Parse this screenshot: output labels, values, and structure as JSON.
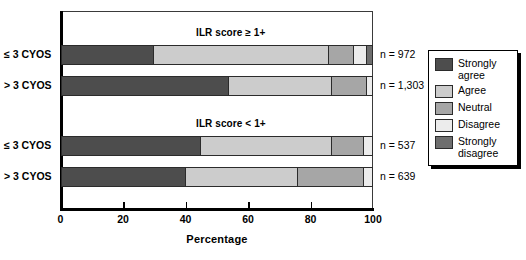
{
  "chart_data": {
    "type": "bar",
    "orientation": "horizontal",
    "stacked": true,
    "title": "",
    "xlabel": "Percentage",
    "ylabel": "",
    "xlim": [
      0,
      100
    ],
    "xticks": [
      0,
      20,
      40,
      60,
      80,
      100
    ],
    "grid": false,
    "legend_position": "right-outside",
    "legend": [
      "Strongly agree",
      "Agree",
      "Neutral",
      "Disagree",
      "Strongly disagree"
    ],
    "series": [
      {
        "name": "Strongly agree",
        "color": "#4d4d4d",
        "values": [
          30,
          54,
          45,
          40
        ]
      },
      {
        "name": "Agree",
        "color": "#cccccc",
        "values": [
          56,
          33,
          42,
          36
        ]
      },
      {
        "name": "Neutral",
        "color": "#a6a6a6",
        "values": [
          8,
          11,
          10,
          21
        ]
      },
      {
        "name": "Disagree",
        "color": "#ececec",
        "values": [
          4,
          2,
          3,
          3
        ]
      },
      {
        "name": "Strongly disagree",
        "color": "#6e6e6e",
        "values": [
          2,
          0,
          0,
          0
        ]
      }
    ],
    "groups": [
      {
        "title": "ILR score ≥ 1+",
        "categories": [
          "≤ 3 CYOS",
          "> 3 CYOS"
        ],
        "n": [
          "n = 972",
          "n = 1,303"
        ]
      },
      {
        "title": "ILR score < 1+",
        "categories": [
          "≤ 3 CYOS",
          "> 3 CYOS"
        ],
        "n": [
          "n = 537",
          "n = 639"
        ]
      }
    ],
    "bars": [
      {
        "category": "≤ 3 CYOS",
        "group": "ILR score ≥ 1+",
        "n_label": "n = 972",
        "segments": [
          {
            "label": "Strongly agree",
            "value": 30,
            "color": "#4d4d4d"
          },
          {
            "label": "Agree",
            "value": 56,
            "color": "#cccccc"
          },
          {
            "label": "Neutral",
            "value": 8,
            "color": "#a6a6a6"
          },
          {
            "label": "Disagree",
            "value": 4,
            "color": "#ececec"
          },
          {
            "label": "Strongly disagree",
            "value": 2,
            "color": "#6e6e6e"
          }
        ]
      },
      {
        "category": "> 3 CYOS",
        "group": "ILR score ≥ 1+",
        "n_label": "n = 1,303",
        "segments": [
          {
            "label": "Strongly agree",
            "value": 54,
            "color": "#4d4d4d"
          },
          {
            "label": "Agree",
            "value": 33,
            "color": "#cccccc"
          },
          {
            "label": "Neutral",
            "value": 11,
            "color": "#a6a6a6"
          },
          {
            "label": "Disagree",
            "value": 2,
            "color": "#ececec"
          }
        ]
      },
      {
        "category": "≤ 3 CYOS",
        "group": "ILR score < 1+",
        "n_label": "n = 537",
        "segments": [
          {
            "label": "Strongly agree",
            "value": 45,
            "color": "#4d4d4d"
          },
          {
            "label": "Agree",
            "value": 42,
            "color": "#cccccc"
          },
          {
            "label": "Neutral",
            "value": 10,
            "color": "#a6a6a6"
          },
          {
            "label": "Disagree",
            "value": 3,
            "color": "#ececec"
          }
        ]
      },
      {
        "category": "> 3 CYOS",
        "group": "ILR score < 1+",
        "n_label": "n = 639",
        "segments": [
          {
            "label": "Strongly agree",
            "value": 40,
            "color": "#4d4d4d"
          },
          {
            "label": "Agree",
            "value": 36,
            "color": "#cccccc"
          },
          {
            "label": "Neutral",
            "value": 21,
            "color": "#a6a6a6"
          },
          {
            "label": "Disagree",
            "value": 3,
            "color": "#ececec"
          }
        ]
      }
    ]
  },
  "axis": {
    "x_title": "Percentage",
    "tick_labels": [
      "0",
      "20",
      "40",
      "60",
      "80",
      "100"
    ]
  },
  "categories": {
    "label_0": "≤ 3 CYOS",
    "label_1": "> 3 CYOS",
    "label_2": "≤ 3 CYOS",
    "label_3": "> 3 CYOS"
  },
  "group_titles": {
    "top": "ILR score ≥ 1+",
    "bottom": "ILR score < 1+"
  },
  "n_labels": {
    "bar_0": "n = 972",
    "bar_1": "n = 1,303",
    "bar_2": "n = 537",
    "bar_3": "n = 639"
  },
  "legend": {
    "items": [
      {
        "label": "Strongly\nagree",
        "color": "#4d4d4d"
      },
      {
        "label": "Agree",
        "color": "#cccccc"
      },
      {
        "label": "Neutral",
        "color": "#a6a6a6"
      },
      {
        "label": "Disagree",
        "color": "#ececec"
      },
      {
        "label": "Strongly\ndisagree",
        "color": "#6e6e6e"
      }
    ]
  }
}
